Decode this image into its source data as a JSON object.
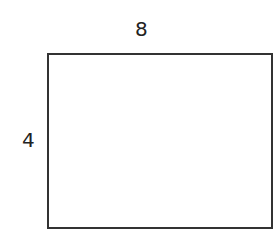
{
  "diagram": {
    "shape": "rectangle",
    "width_label": "8",
    "height_label": "4",
    "stroke_color": "#333333"
  }
}
